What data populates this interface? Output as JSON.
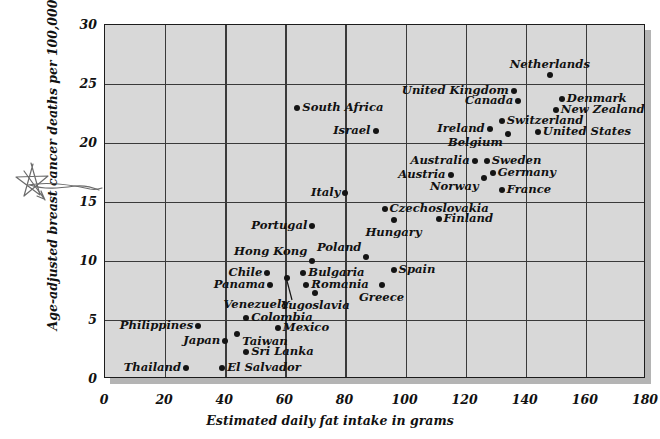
{
  "chart_data": {
    "type": "scatter",
    "title": "",
    "xlabel": "Estimated daily fat intake in grams",
    "ylabel": "Age-adjusted breast cancer deaths per 100,000 population",
    "xlim": [
      0,
      180
    ],
    "ylim": [
      0,
      30
    ],
    "xticks": [
      "0",
      "20",
      "40",
      "60",
      "80",
      "100",
      "120",
      "140",
      "160",
      "180"
    ],
    "yticks": [
      "0",
      "5",
      "10",
      "15",
      "20",
      "25",
      "30"
    ],
    "grid": true,
    "legend": "none",
    "points": [
      {
        "label": "Netherlands",
        "x": 148,
        "y": 25.8,
        "label_pos": "above"
      },
      {
        "label": "Denmark",
        "x": 152,
        "y": 23.7,
        "label_pos": "right"
      },
      {
        "label": "New Zealand",
        "x": 150,
        "y": 22.8,
        "label_pos": "right"
      },
      {
        "label": "United Kingdom",
        "x": 136,
        "y": 24.4,
        "label_pos": "left"
      },
      {
        "label": "Canada",
        "x": 137.5,
        "y": 23.6,
        "label_pos": "left"
      },
      {
        "label": "Switzerland",
        "x": 132,
        "y": 21.9,
        "label_pos": "right"
      },
      {
        "label": "Ireland",
        "x": 128,
        "y": 21.2,
        "label_pos": "left"
      },
      {
        "label": "United States",
        "x": 144,
        "y": 20.9,
        "label_pos": "right"
      },
      {
        "label": "Belgium",
        "x": 134,
        "y": 20.8,
        "label_pos": "below-left"
      },
      {
        "label": "Australia",
        "x": 123,
        "y": 18.5,
        "label_pos": "left"
      },
      {
        "label": "Sweden",
        "x": 127,
        "y": 18.5,
        "label_pos": "right"
      },
      {
        "label": "Germany",
        "x": 129,
        "y": 17.5,
        "label_pos": "right"
      },
      {
        "label": "Austria",
        "x": 115,
        "y": 17.3,
        "label_pos": "left"
      },
      {
        "label": "Norway",
        "x": 126,
        "y": 17.0,
        "label_pos": "below-left"
      },
      {
        "label": "France",
        "x": 132,
        "y": 16.0,
        "label_pos": "right"
      },
      {
        "label": "South Africa",
        "x": 64,
        "y": 23.0,
        "label_pos": "right"
      },
      {
        "label": "Israel",
        "x": 90,
        "y": 21.0,
        "label_pos": "left"
      },
      {
        "label": "Italy",
        "x": 80,
        "y": 15.8,
        "label_pos": "left"
      },
      {
        "label": "Czechoslovakia",
        "x": 93,
        "y": 14.4,
        "label_pos": "right"
      },
      {
        "label": "Finland",
        "x": 111,
        "y": 13.6,
        "label_pos": "right"
      },
      {
        "label": "Hungary",
        "x": 96,
        "y": 13.5,
        "label_pos": "below"
      },
      {
        "label": "Portugal",
        "x": 69,
        "y": 13.0,
        "label_pos": "left"
      },
      {
        "label": "Hong Kong",
        "x": 69,
        "y": 10.0,
        "label_pos": "above-left"
      },
      {
        "label": "Poland",
        "x": 87,
        "y": 10.3,
        "label_pos": "above-left"
      },
      {
        "label": "Bulgaria",
        "x": 66,
        "y": 9.0,
        "label_pos": "right"
      },
      {
        "label": "Spain",
        "x": 96,
        "y": 9.2,
        "label_pos": "right"
      },
      {
        "label": "Romania",
        "x": 67,
        "y": 8.0,
        "label_pos": "right"
      },
      {
        "label": "Greece",
        "x": 92,
        "y": 8.0,
        "label_pos": "below"
      },
      {
        "label": "Chile",
        "x": 54,
        "y": 9.0,
        "label_pos": "left"
      },
      {
        "label": "Panama",
        "x": 55,
        "y": 8.0,
        "label_pos": "left"
      },
      {
        "label": "Venezuela",
        "x": 60.5,
        "y": 8.6,
        "label_pos": "leader-below-left"
      },
      {
        "label": "Yugoslavia",
        "x": 70,
        "y": 7.3,
        "label_pos": "below"
      },
      {
        "label": "Colombia",
        "x": 47,
        "y": 5.2,
        "label_pos": "right"
      },
      {
        "label": "Mexico",
        "x": 57.5,
        "y": 4.3,
        "label_pos": "right"
      },
      {
        "label": "Philippines",
        "x": 31,
        "y": 4.5,
        "label_pos": "left"
      },
      {
        "label": "Taiwan",
        "x": 44,
        "y": 3.8,
        "label_pos": "below-right"
      },
      {
        "label": "Japan",
        "x": 40,
        "y": 3.2,
        "label_pos": "left"
      },
      {
        "label": "Sri Lanka",
        "x": 47,
        "y": 2.3,
        "label_pos": "right"
      },
      {
        "label": "Thailand",
        "x": 27,
        "y": 0.9,
        "label_pos": "left"
      },
      {
        "label": "El Salvador",
        "x": 39,
        "y": 0.9,
        "label_pos": "right"
      }
    ],
    "annotations": [
      {
        "name": "hand-drawn-star",
        "description": "hand-drawn star with curved line pointing at the y-axis value 15"
      }
    ],
    "colors": {
      "plot_background": "#d8d8d8",
      "grid": "#3a3a3a",
      "point": "#141414",
      "text": "#111111",
      "page_background": "#ffffff",
      "shadow": "#b4b4b4"
    }
  }
}
